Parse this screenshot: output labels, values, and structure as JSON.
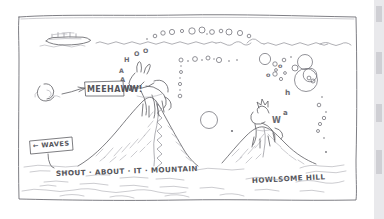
{
  "artwork": {
    "medium": "hand-drawn pen sketch",
    "title_not_shown": "",
    "background_color": "#ffffff",
    "ink_color": "#5d5d62"
  },
  "labels": {
    "callout_meehaww": "MEEHAWW!",
    "callout_waves": "← WAVES",
    "landmark_left": "SHOUT · ABOUT · IT · MOUNTAIN",
    "landmark_right": "HOWLSOME HILL"
  },
  "sound_arcs": {
    "left_animal_call": [
      "W",
      "A",
      "A",
      "H",
      "O",
      "O"
    ],
    "right_animal_call": [
      "W",
      "a",
      "h",
      "o",
      "o"
    ],
    "circle_count_top": 11,
    "circle_count_right": 9
  },
  "scene_elements": {
    "ship_on_horizon": "ship-silhouette",
    "left_creature": "donkey-braying",
    "right_creature": "wolf-howling",
    "horizon": "sea-horizon-line",
    "left_peak": "mountain-left",
    "right_peak": "hill-right",
    "frame": "hand-drawn-border"
  },
  "scan_artifact": {
    "right_edge_strip": "page-edge-shadow"
  }
}
